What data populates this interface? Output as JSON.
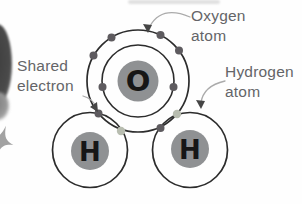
{
  "labels": {
    "oxygen_atom": "Oxygen atom",
    "hydrogen_atom": "Hydrogen atom",
    "shared_electron": "Shared electron"
  },
  "symbols": {
    "oxygen": "O",
    "hydrogen": "H"
  },
  "colors": {
    "outline": "#2c2c2c",
    "nucleus_fill": "#8f9193",
    "oxygen_electron": "#5e5b5f",
    "shared_electron": "#b8bdb0",
    "label_text": "#646568",
    "arrow_line": "#ababab",
    "arrowhead": "#454545",
    "page_fragment": "#4a4a4a"
  }
}
